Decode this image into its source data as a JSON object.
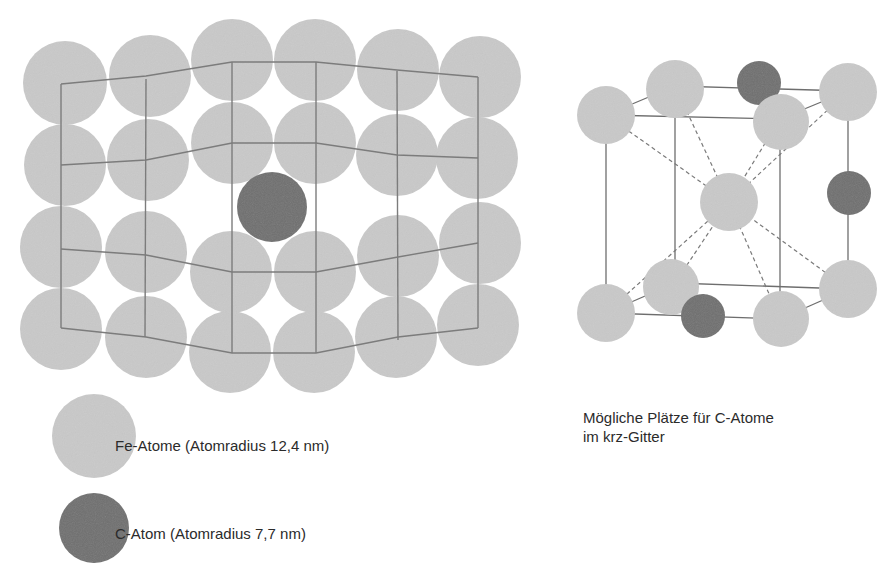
{
  "figure": {
    "left_panel": {
      "description": "Fe lattice (2D section) with interstitial C atom distorting lattice",
      "fe_color": "#c8c8c8",
      "c_color": "#6f6f6f",
      "line_color": "#7a7a7a"
    },
    "right_panel": {
      "description": "krz (bcc) unit cell with possible C interstitial sites",
      "caption_line1": "Mögliche Plätze für C-Atome",
      "caption_line2": "im krz-Gitter"
    },
    "legend": {
      "items": [
        {
          "label": "Fe-Atome (Atomradius 12,4 nm)",
          "color": "#c8c8c8"
        },
        {
          "label": "C-Atom (Atomradius 7,7 nm)",
          "color": "#6f6f6f"
        }
      ]
    }
  }
}
